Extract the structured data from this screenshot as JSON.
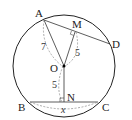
{
  "diagram": {
    "type": "circle-geometry",
    "points": {
      "A": {
        "label": "A",
        "x": 44,
        "y": 20
      },
      "M": {
        "label": "M",
        "x": 75,
        "y": 32
      },
      "D": {
        "label": "D",
        "x": 110,
        "y": 44
      },
      "O": {
        "label": "O",
        "x": 64,
        "y": 66
      },
      "N": {
        "label": "N",
        "x": 64,
        "y": 102
      },
      "B": {
        "label": "B",
        "x": 30,
        "y": 102
      },
      "C": {
        "label": "C",
        "x": 98,
        "y": 102
      }
    },
    "circle": {
      "cx": 64,
      "cy": 66,
      "r": 51
    },
    "measurements": {
      "AO": "7",
      "OM": "5",
      "ON": "5",
      "BC": "x"
    },
    "colors": {
      "stroke": "#222222",
      "dashed": "#777777",
      "center_dot": "#000000"
    }
  }
}
